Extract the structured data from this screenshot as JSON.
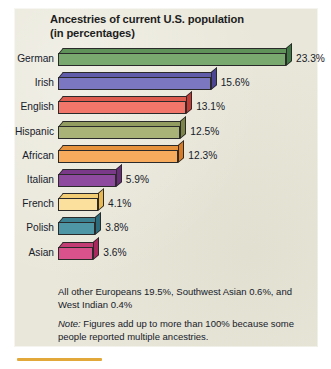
{
  "chart_data": {
    "type": "bar",
    "orientation": "horizontal",
    "title": "Ancestries of current U.S. population",
    "subtitle": "(in percentages)",
    "xlabel": "",
    "ylabel": "",
    "xlim": [
      0,
      23.3
    ],
    "grid": false,
    "legend": "none",
    "value_suffix": "%",
    "categories": [
      "German",
      "Irish",
      "English",
      "Hispanic",
      "African",
      "Italian",
      "French",
      "Polish",
      "Asian"
    ],
    "values": [
      23.3,
      15.6,
      13.1,
      12.5,
      12.3,
      5.9,
      4.1,
      3.8,
      3.6
    ],
    "value_labels": [
      "23.3%",
      "15.6%",
      "13.1%",
      "12.5%",
      "12.3%",
      "5.9%",
      "4.1%",
      "3.8%",
      "3.6%"
    ],
    "bar_colors": [
      "#7aa970",
      "#7b77c0",
      "#f2766a",
      "#a9b277",
      "#f7ab5c",
      "#8e4a9e",
      "#fadf9d",
      "#4e96a6",
      "#d9528b"
    ],
    "bar_colors_side": [
      "#3f7a44",
      "#4b4593",
      "#c33c33",
      "#7c8448",
      "#d97b22",
      "#6a2d78",
      "#e9b84f",
      "#2c6b7c",
      "#a9295f"
    ],
    "bar_colors_top": [
      "#5f9258",
      "#615ca9",
      "#dc5a4e",
      "#939c60",
      "#e6923c",
      "#7a3a89",
      "#f3cd74",
      "#3b8192",
      "#c33c74"
    ],
    "annotations": [
      "All other Europeans 19.5%, Southwest Asian 0.6%, and West Indian 0.4%",
      "Note: Figures add up to more than 100% because some people reported multiple ancestries."
    ]
  },
  "figure": {
    "panel_color": "#e9e7d9",
    "text_color": "#16202a",
    "title_color": "#1d1d1d",
    "rule_color": "#e3a83a"
  },
  "notes": {
    "note1": "All other Europeans 19.5%, Southwest Asian 0.6%, and West Indian 0.4%",
    "note2_prefix": "Note:",
    "note2_body": " Figures add up to more than 100% because some people reported multiple ancestries."
  }
}
